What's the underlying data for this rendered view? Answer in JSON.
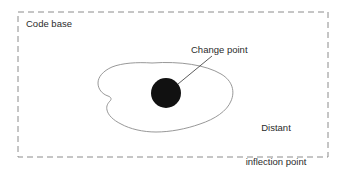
{
  "diagram": {
    "title_label": "Code base",
    "container": {
      "name": "code-base-boundary",
      "style": "dashed-rectangle",
      "stroke": "#8c8c8c",
      "dash": "6 4",
      "x": 18,
      "y": 12,
      "width": 310,
      "height": 145
    },
    "region": {
      "name": "affected-region-blob",
      "stroke": "#8c8c8c",
      "fill": "#ffffff"
    },
    "change_point": {
      "label": "Change point",
      "shape": "filled-circle",
      "fill": "#111111",
      "center_x": 166,
      "center_y": 93,
      "radius": 15
    },
    "distant_inflection_point": {
      "label_line1": "Distant",
      "label_line2": "inflection point"
    },
    "leader_line": {
      "name": "change-point-leader-line",
      "stroke": "#4a4a4a",
      "from_x": 178,
      "from_y": 84,
      "to_x": 212,
      "to_y": 56
    },
    "colors": {
      "background": "#ffffff",
      "text": "#2b2b2b",
      "outline": "#8c8c8c",
      "solid_fill": "#111111"
    }
  }
}
